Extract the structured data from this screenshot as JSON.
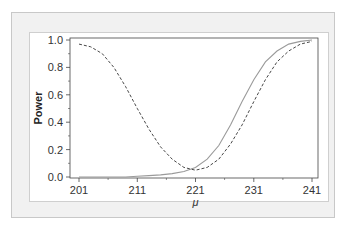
{
  "chart_data": {
    "type": "line",
    "title": "",
    "xlabel": "μ",
    "ylabel": "Power",
    "xlim": [
      201,
      241
    ],
    "ylim": [
      0.0,
      1.0
    ],
    "x_ticks": [
      "201",
      "211",
      "221",
      "231",
      "241"
    ],
    "y_ticks": [
      "0.0",
      "0.2",
      "0.4",
      "0.6",
      "0.8",
      "1.0"
    ],
    "grid": false,
    "legend": null,
    "x": [
      201,
      203,
      205,
      207,
      209,
      211,
      213,
      215,
      217,
      219,
      221,
      223,
      225,
      227,
      229,
      231,
      233,
      235,
      237,
      239,
      241
    ],
    "series": [
      {
        "name": "solid (one-sided test)",
        "style": "solid",
        "color": "#9a9a9a",
        "values": [
          0.0,
          0.0,
          0.0,
          0.0,
          0.0,
          0.005,
          0.01,
          0.015,
          0.025,
          0.04,
          0.07,
          0.13,
          0.23,
          0.38,
          0.55,
          0.71,
          0.84,
          0.92,
          0.97,
          0.99,
          1.0
        ]
      },
      {
        "name": "dashed (two-sided test)",
        "style": "dashed",
        "color": "#333333",
        "values": [
          0.97,
          0.95,
          0.9,
          0.8,
          0.66,
          0.5,
          0.35,
          0.22,
          0.13,
          0.07,
          0.05,
          0.07,
          0.13,
          0.24,
          0.38,
          0.55,
          0.71,
          0.84,
          0.92,
          0.97,
          0.99
        ]
      }
    ]
  },
  "axes": {
    "ylabel": "Power",
    "xlabel": "μ",
    "x_ticks": [
      "201",
      "211",
      "221",
      "231",
      "241"
    ],
    "y_ticks": [
      "0.0",
      "0.2",
      "0.4",
      "0.6",
      "0.8",
      "1.0"
    ]
  }
}
